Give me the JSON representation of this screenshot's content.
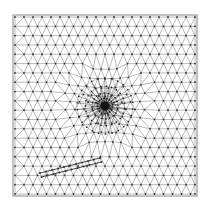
{
  "diagram": {
    "type": "triangular-mesh",
    "colors": {
      "background": "#ffffff",
      "frame": "#9a9a9a",
      "edge": "#8a8a8a",
      "node": "#333333",
      "dense": "#111111"
    },
    "domain": {
      "x0": 15,
      "y0": 17,
      "x1": 195,
      "y1": 194
    },
    "grid": {
      "cols": 21,
      "rows": 20
    },
    "refinement_center": {
      "x": 105,
      "y": 106,
      "radius": 30
    },
    "crack": {
      "from": {
        "x": 40,
        "y": 173
      },
      "to": {
        "x": 100,
        "y": 158
      }
    }
  }
}
